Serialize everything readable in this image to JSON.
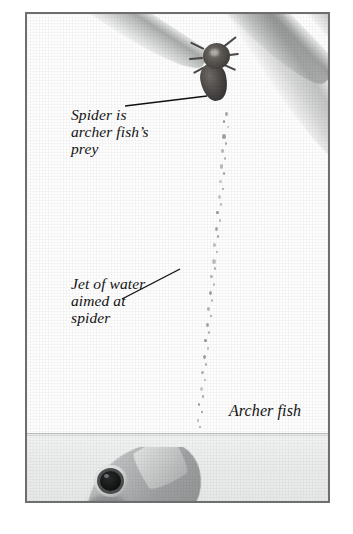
{
  "figure": {
    "scene": "archer-fish-shooting-water-at-spider",
    "frame_border_color": "#6e6e6e",
    "background_color": "#ffffff",
    "water_color": "#eceded",
    "air_color": "#fefefe"
  },
  "annotations": [
    {
      "id": "spider-label",
      "text": "Spider is\narcher fish’s\nprey",
      "leader_from": [
        98,
        92
      ],
      "leader_to": [
        180,
        82
      ]
    },
    {
      "id": "jet-label",
      "text": "Jet of water\naimed at\nspider",
      "leader_from": [
        95,
        285
      ],
      "leader_to": [
        153,
        255
      ]
    },
    {
      "id": "fish-label",
      "text": "Archer fish",
      "leader_from": null,
      "leader_to": null
    }
  ],
  "elements": {
    "spider_label_text": "Spider is\narcher fish’s\nprey",
    "jet_label_text": "Jet of water\naimed at\nspider",
    "fish_label_text": "Archer fish"
  },
  "scene_objects": {
    "spider": {
      "name": "spider",
      "position": [
        165,
        23
      ]
    },
    "water_jet": {
      "name": "jet-of-water",
      "description": "vertical trail of water droplets"
    },
    "archer_fish": {
      "name": "archer-fish",
      "description": "fish head breaking water surface, large dark eye"
    },
    "leaves": {
      "count": 5,
      "description": "narrow tapering grey leaf blades angled upper-right to lower-left"
    },
    "water_surface": {
      "y": 419
    }
  },
  "droplets": [
    [
      198,
      98,
      3.2,
      4.4
    ],
    [
      196,
      106,
      2.2,
      2.8
    ],
    [
      200,
      112,
      2.0,
      2.4
    ],
    [
      195,
      120,
      3.6,
      5.2
    ],
    [
      198,
      128,
      2.4,
      3.0
    ],
    [
      194,
      135,
      2.8,
      3.6
    ],
    [
      197,
      143,
      2.0,
      2.6
    ],
    [
      193,
      150,
      3.4,
      4.6
    ],
    [
      196,
      158,
      2.2,
      2.8
    ],
    [
      192,
      166,
      2.6,
      3.4
    ],
    [
      195,
      174,
      2.0,
      2.4
    ],
    [
      191,
      181,
      3.0,
      4.0
    ],
    [
      193,
      189,
      2.2,
      2.8
    ],
    [
      189,
      197,
      2.6,
      3.4
    ],
    [
      192,
      205,
      2.0,
      2.6
    ],
    [
      188,
      213,
      3.4,
      4.4
    ],
    [
      190,
      221,
      2.2,
      2.8
    ],
    [
      186,
      229,
      2.8,
      3.6
    ],
    [
      189,
      237,
      2.0,
      2.4
    ],
    [
      185,
      245,
      3.8,
      5.0
    ],
    [
      187,
      253,
      2.4,
      3.0
    ],
    [
      183,
      261,
      2.6,
      3.4
    ],
    [
      186,
      269,
      2.0,
      2.6
    ],
    [
      182,
      277,
      3.2,
      4.2
    ],
    [
      184,
      285,
      2.2,
      2.8
    ],
    [
      180,
      293,
      2.8,
      3.6
    ],
    [
      183,
      301,
      2.0,
      2.4
    ],
    [
      179,
      309,
      3.4,
      4.4
    ],
    [
      181,
      317,
      2.2,
      2.8
    ],
    [
      177,
      325,
      2.6,
      3.4
    ],
    [
      180,
      333,
      2.0,
      2.6
    ],
    [
      176,
      341,
      3.0,
      4.0
    ],
    [
      178,
      349,
      2.2,
      2.8
    ],
    [
      174,
      357,
      2.6,
      3.4
    ],
    [
      177,
      365,
      2.0,
      2.4
    ],
    [
      173,
      373,
      3.2,
      4.2
    ],
    [
      175,
      381,
      2.2,
      2.8
    ],
    [
      171,
      389,
      2.4,
      3.2
    ],
    [
      174,
      397,
      1.8,
      2.4
    ],
    [
      170,
      405,
      2.4,
      3.2
    ],
    [
      172,
      412,
      1.8,
      2.2
    ]
  ]
}
